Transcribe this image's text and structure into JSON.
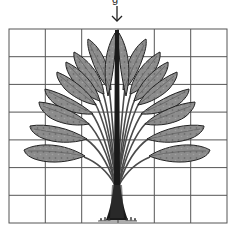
{
  "figure": {
    "top_label": "g",
    "arrow": {
      "direction": "down",
      "glyph": "↓",
      "target": "tree-trunk-top"
    },
    "grid": {
      "columns": 6,
      "rows": 7,
      "left": 9,
      "top": 29,
      "right": 227,
      "bottom": 223,
      "line_color": "#555555"
    },
    "tree": {
      "leaf_color": "#8a8a8a",
      "leaf_outline": "#2a2a2a",
      "trunk_color": "#111111",
      "leaves_per_side": 9,
      "symmetry_axis_x": 117
    }
  }
}
